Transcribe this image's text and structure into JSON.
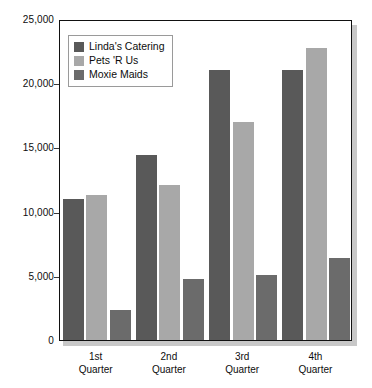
{
  "chart_data": {
    "type": "bar",
    "title": "",
    "xlabel": "",
    "ylabel": "",
    "categories": [
      "1st Quarter",
      "2nd Quarter",
      "3rd Quarter",
      "4th Quarter"
    ],
    "category_lines": [
      [
        "1st",
        "Quarter"
      ],
      [
        "2nd",
        "Quarter"
      ],
      [
        "3rd",
        "Quarter"
      ],
      [
        "4th",
        "Quarter"
      ]
    ],
    "series": [
      {
        "name": "Linda's Catering",
        "color": "#595959",
        "values": [
          11000,
          14375,
          21000,
          21000
        ]
      },
      {
        "name": "Pets 'R Us",
        "color": "#a8a8a8",
        "values": [
          11300,
          12100,
          17000,
          22750
        ]
      },
      {
        "name": "Moxie Maids",
        "color": "#6b6b6b",
        "values": [
          2350,
          4750,
          5050,
          6400
        ]
      }
    ],
    "ylim": [
      0,
      25000
    ],
    "y_ticks": [
      0,
      5000,
      10000,
      15000,
      20000,
      25000
    ],
    "y_tick_labels": [
      "0",
      "5,000",
      "10,000",
      "15,000",
      "20,000",
      "25,000"
    ],
    "grid": false,
    "legend_position": "top-left"
  },
  "legend": {
    "items": [
      {
        "label": "Linda's Catering",
        "color": "#595959"
      },
      {
        "label": "Pets 'R Us",
        "color": "#a8a8a8"
      },
      {
        "label": "Moxie Maids",
        "color": "#6b6b6b"
      }
    ]
  },
  "colors": {
    "axis": "#111111",
    "text": "#0d0d0d",
    "plot_background": "#ffffff",
    "shadow": "#c8c8c8"
  }
}
